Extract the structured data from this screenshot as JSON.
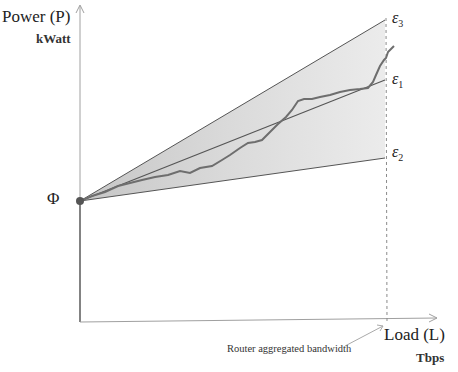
{
  "diagram": {
    "y_axis": {
      "label": "Power (P)",
      "unit": "kWatt"
    },
    "x_axis": {
      "label": "Load (L)",
      "unit": "Tbps"
    },
    "origin_label": "Φ",
    "lines": [
      {
        "name": "ε",
        "sub": "3",
        "role": "upper bound"
      },
      {
        "name": "ε",
        "sub": "1",
        "role": "linear"
      },
      {
        "name": "ε",
        "sub": "2",
        "role": "lower bound"
      }
    ],
    "annotation": "Router aggregated bandwidth",
    "colors": {
      "axis": "#9a9a9a",
      "line": "#555555",
      "curve": "#6e6e6e",
      "fill": "#d6d6d6",
      "dot": "#555555"
    }
  }
}
